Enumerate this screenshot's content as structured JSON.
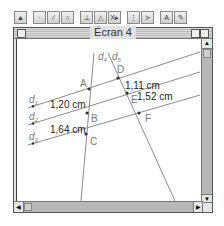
{
  "toolbar": {
    "groups": [
      [
        {
          "name": "pointer-tool",
          "glyph": "▲"
        }
      ],
      [
        {
          "name": "point-tool",
          "glyph": "·"
        },
        {
          "name": "line-tool",
          "glyph": "⁄"
        },
        {
          "name": "circle-tool",
          "glyph": "○"
        }
      ],
      [
        {
          "name": "construct-tool",
          "glyph": "⊥"
        },
        {
          "name": "transform-tool",
          "glyph": "△"
        },
        {
          "name": "macro-tool",
          "glyph": "X▸"
        }
      ],
      [
        {
          "name": "measure-tool",
          "glyph": "⋮"
        },
        {
          "name": "graph-tool",
          "glyph": "≻"
        }
      ],
      [
        {
          "name": "text-tool",
          "glyph": "A"
        },
        {
          "name": "display-tool",
          "glyph": "✎"
        }
      ]
    ]
  },
  "window": {
    "title": "Écran 4"
  },
  "figure": {
    "lines": [
      {
        "id": "d1",
        "label": "d",
        "sub": "1",
        "x1": 28,
        "y1": 108,
        "x2": 200,
        "y2": 52
      },
      {
        "id": "d2",
        "label": "d",
        "sub": "2",
        "x1": 28,
        "y1": 125,
        "x2": 200,
        "y2": 72
      },
      {
        "id": "d3",
        "label": "d",
        "sub": "3",
        "x1": 28,
        "y1": 145,
        "x2": 200,
        "y2": 95
      },
      {
        "id": "d4",
        "label": "d",
        "sub": "4",
        "x1": 94,
        "y1": 53,
        "x2": 80,
        "y2": 212
      },
      {
        "id": "d5",
        "label": "d",
        "sub": "5",
        "x1": 108,
        "y1": 53,
        "x2": 180,
        "y2": 212
      }
    ],
    "points": [
      {
        "id": "A",
        "label": "A",
        "x": 89,
        "y": 89,
        "lx": 80,
        "ly": 87
      },
      {
        "id": "B",
        "label": "B",
        "x": 87,
        "y": 113,
        "lx": 91,
        "ly": 122
      },
      {
        "id": "C",
        "label": "C",
        "x": 86,
        "y": 134,
        "lx": 90,
        "ly": 145
      },
      {
        "id": "D",
        "label": "D",
        "x": 118,
        "y": 78,
        "lx": 117,
        "ly": 73
      },
      {
        "id": "E",
        "label": "E",
        "x": 127,
        "y": 93,
        "lx": 131,
        "ly": 103
      },
      {
        "id": "F",
        "label": "F",
        "x": 139,
        "y": 113,
        "lx": 145,
        "ly": 122
      }
    ],
    "line_labels": [
      {
        "for": "d1",
        "x": 29,
        "y": 103
      },
      {
        "for": "d2",
        "x": 29,
        "y": 120
      },
      {
        "for": "d3",
        "x": 29,
        "y": 140
      },
      {
        "for": "d4",
        "x": 98,
        "y": 60
      },
      {
        "for": "d5",
        "x": 112,
        "y": 60
      }
    ],
    "measures": [
      {
        "id": "m1",
        "text": "1,20 cm",
        "x": 50,
        "y": 108
      },
      {
        "id": "m2",
        "text": "1,64 cm",
        "x": 50,
        "y": 133
      },
      {
        "id": "m3",
        "text": "1,11 cm",
        "x": 125,
        "y": 89
      },
      {
        "id": "m4",
        "text": "1,52 cm",
        "x": 137,
        "y": 100
      }
    ],
    "colors": {
      "line": "#8a8a8a",
      "point": "#333333",
      "text": "#222222",
      "label": "#777777"
    }
  }
}
